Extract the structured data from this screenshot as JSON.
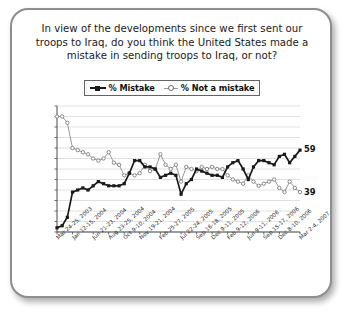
{
  "card": {
    "title": "In view of the developments since we first sent our troops to Iraq, do you think the United States made a mistake in sending troops to Iraq, or not?"
  },
  "legend": {
    "items": [
      {
        "label": "% Mistake",
        "marker": "filled-square-line",
        "color": "#1a1a1a"
      },
      {
        "label": "% Not a mistake",
        "marker": "open-circle-line",
        "color": "#7d7d7d"
      }
    ]
  },
  "end_labels": {
    "mistake": "59",
    "not_mistake": "39"
  },
  "chart_data": {
    "type": "line",
    "title": "In view of the developments since we first sent our troops to Iraq, do you think the United States made a mistake in sending troops to Iraq, or not?",
    "xlabel": "",
    "ylabel": "",
    "ylim": [
      20,
      80
    ],
    "ytick_step": 5,
    "yticks": [
      80,
      75,
      70,
      65,
      60,
      55,
      50,
      45,
      40,
      35,
      30,
      25,
      20
    ],
    "grid": true,
    "legend_position": "top-center",
    "x_tick_labels": [
      "Mar 24-25, 2003",
      "Jan 12-15, 2004",
      "Jun 21-23, 2004",
      "Aug 23-25, 2004",
      "Oct 9-10, 2004",
      "Nov 19-21, 2004",
      "Feb 25-27, 2005",
      "Jul 22-24, 2005",
      "Sep 16-18, 2005",
      "Dec 9-11, 2005",
      "Feb 9-12, 2006",
      "Jun 9-11, 2006",
      "Sep 15-17, 2006",
      "Dec 8-10, 2006",
      "Mar 2-4, 2007"
    ],
    "x_tick_indices": [
      0,
      3,
      7,
      10,
      13,
      16,
      20,
      24,
      27,
      30,
      33,
      37,
      40,
      43,
      47
    ],
    "series": [
      {
        "name": "% Mistake",
        "color": "#1a1a1a",
        "marker": "filled-square",
        "values": [
          22,
          23,
          27,
          39,
          40,
          41,
          40,
          42,
          44,
          43,
          42,
          42,
          42,
          43,
          48,
          54,
          54,
          51,
          51,
          50,
          46,
          47,
          48,
          47,
          38,
          43,
          45,
          50,
          49,
          48,
          47,
          47,
          46,
          51,
          53,
          54,
          50,
          45,
          51,
          54,
          54,
          53,
          52,
          56,
          57,
          53,
          56,
          59
        ]
      },
      {
        "name": "% Not a mistake",
        "color": "#7d7d7d",
        "marker": "open-circle",
        "values": [
          75,
          75,
          72,
          60,
          59,
          58,
          57,
          55,
          54,
          55,
          58,
          53,
          52,
          47,
          48,
          47,
          48,
          52,
          49,
          50,
          57,
          52,
          50,
          52,
          44,
          51,
          50,
          49,
          51,
          50,
          51,
          50,
          50,
          47,
          45,
          44,
          43,
          47,
          44,
          42,
          43,
          44,
          45,
          41,
          39,
          44,
          41,
          39
        ]
      }
    ]
  }
}
